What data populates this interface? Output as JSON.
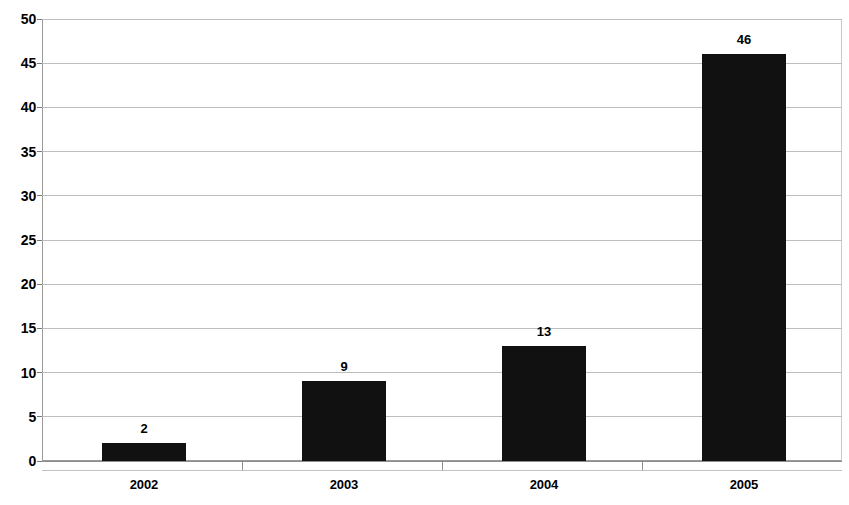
{
  "chart_data": {
    "type": "bar",
    "title": "",
    "subtitle": "",
    "xlabel": "",
    "ylabel": "",
    "categories": [
      "2002",
      "2003",
      "2004",
      "2005"
    ],
    "values": [
      2,
      9,
      13,
      46
    ],
    "data_labels": [
      "2",
      "9",
      "13",
      "46"
    ],
    "ylim": [
      0,
      50
    ],
    "y_ticks": [
      0,
      5,
      10,
      15,
      20,
      25,
      30,
      35,
      40,
      45,
      50
    ],
    "y_tick_labels": [
      "0",
      "5",
      "10",
      "15",
      "20",
      "25",
      "30",
      "35",
      "40",
      "45",
      "50"
    ],
    "grid": true,
    "legend": false,
    "bar_color": "#111111",
    "grid_color": "#bdbdbd",
    "axis_color": "#8d8d8d",
    "background_color": "#ffffff"
  }
}
